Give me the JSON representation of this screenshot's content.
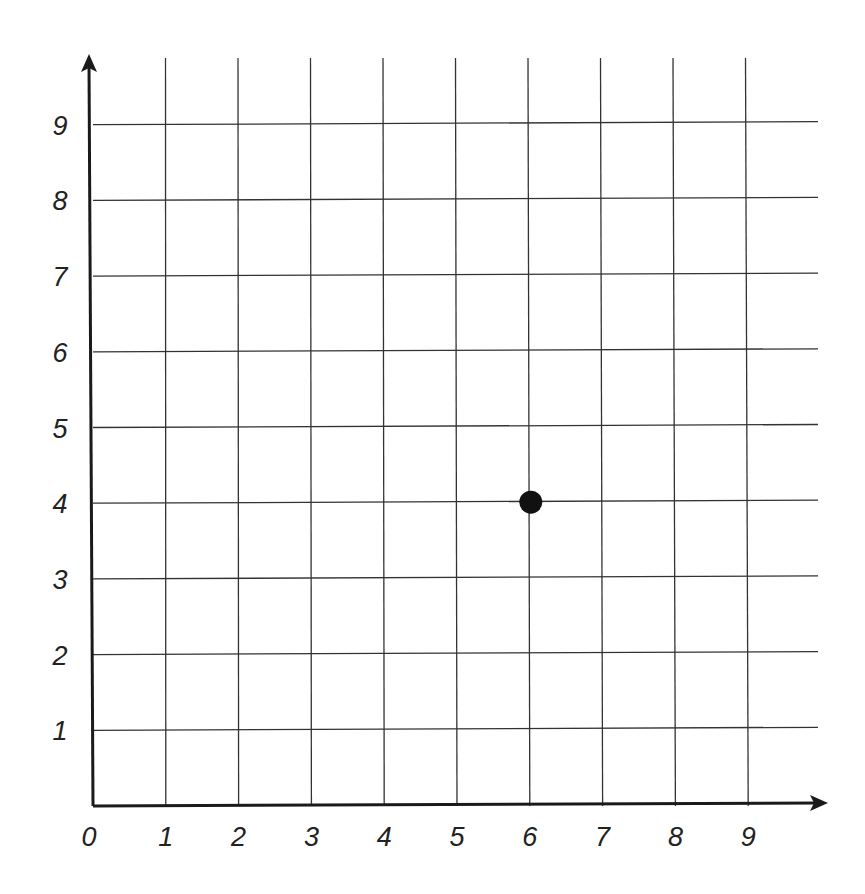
{
  "chart_data": {
    "type": "scatter",
    "title": "",
    "xlabel": "",
    "ylabel": "",
    "xlim": [
      0,
      10
    ],
    "ylim": [
      0,
      10
    ],
    "grid": true,
    "x_ticks": [
      "0",
      "1",
      "2",
      "3",
      "4",
      "5",
      "6",
      "7",
      "8",
      "9"
    ],
    "y_ticks": [
      "1",
      "2",
      "3",
      "4",
      "5",
      "6",
      "7",
      "8",
      "9"
    ],
    "series": [
      {
        "name": "point",
        "points": [
          {
            "x": 6,
            "y": 4
          }
        ]
      }
    ]
  },
  "colors": {
    "axis": "#1a1a1a",
    "grid": "#333333",
    "point": "#111111",
    "background": "#ffffff"
  }
}
